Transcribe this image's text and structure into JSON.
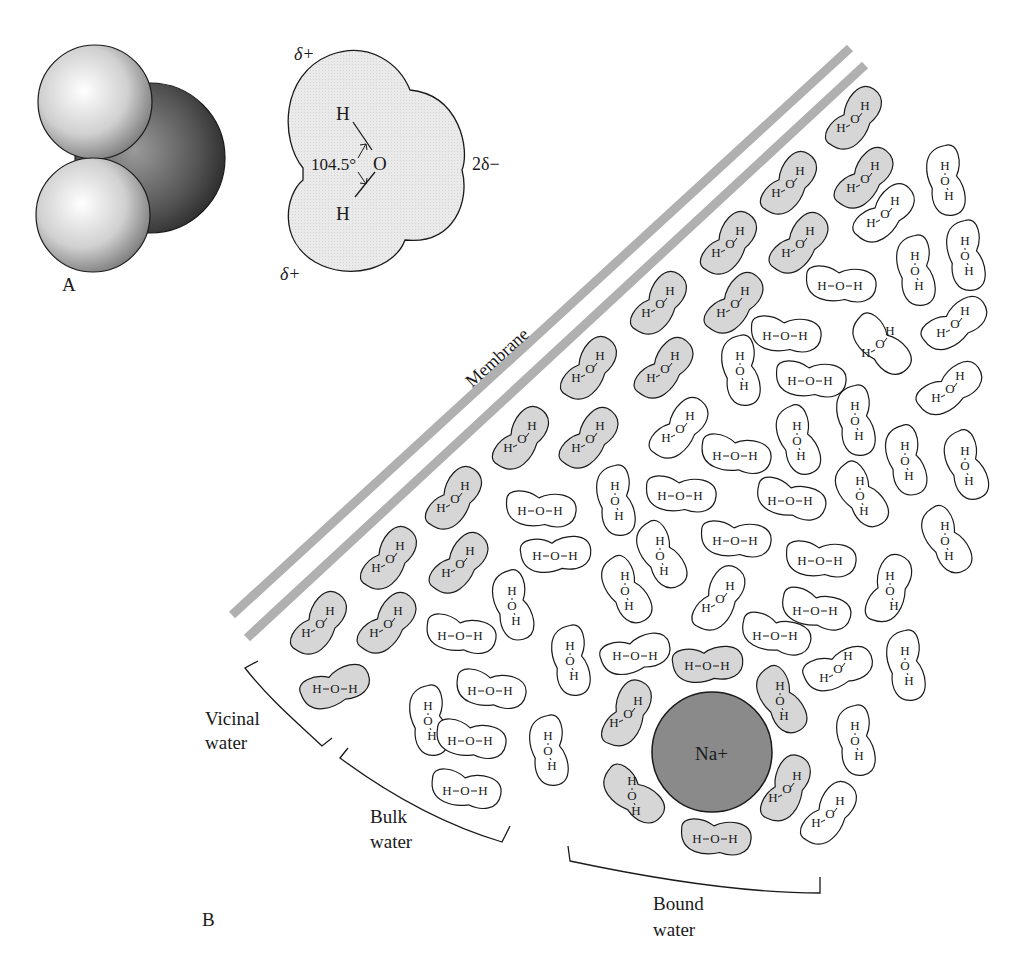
{
  "figure": {
    "panel_a_label": "A",
    "panel_b_label": "B",
    "water_model": {
      "angle_label": "104.5°",
      "oxygen": "O",
      "hydrogen_top": "H",
      "hydrogen_bottom": "H",
      "delta_plus_top": "δ+",
      "delta_plus_bottom": "δ+",
      "delta_minus": "2δ−"
    },
    "membrane_label": "Membrane",
    "regions": {
      "vicinal": [
        "Vicinal",
        "water"
      ],
      "bulk": [
        "Bulk",
        "water"
      ],
      "bound": [
        "Bound",
        "water"
      ]
    },
    "ion_label": "Na+",
    "colors": {
      "shaded_molecule": "#d6d6d6",
      "membrane": "#b0b0b0",
      "ion": "#8a8a8a",
      "outline": "#1a1a1a"
    },
    "molecules": [
      {
        "x": 855,
        "y": 120,
        "rot": -55,
        "shaded": true,
        "form": "bent"
      },
      {
        "x": 790,
        "y": 185,
        "rot": -55,
        "shaded": true,
        "form": "bent"
      },
      {
        "x": 865,
        "y": 180,
        "rot": -50,
        "shaded": true,
        "form": "bent"
      },
      {
        "x": 730,
        "y": 245,
        "rot": -55,
        "shaded": true,
        "form": "bent"
      },
      {
        "x": 800,
        "y": 245,
        "rot": -50,
        "shaded": true,
        "form": "bent"
      },
      {
        "x": 660,
        "y": 305,
        "rot": -55,
        "shaded": true,
        "form": "bent"
      },
      {
        "x": 735,
        "y": 305,
        "rot": -50,
        "shaded": true,
        "form": "bent"
      },
      {
        "x": 590,
        "y": 370,
        "rot": -55,
        "shaded": true,
        "form": "bent"
      },
      {
        "x": 665,
        "y": 370,
        "rot": -50,
        "shaded": true,
        "form": "bent"
      },
      {
        "x": 522,
        "y": 440,
        "rot": -55,
        "shaded": true,
        "form": "bent"
      },
      {
        "x": 590,
        "y": 440,
        "rot": -50,
        "shaded": true,
        "form": "bent"
      },
      {
        "x": 455,
        "y": 500,
        "rot": -55,
        "shaded": true,
        "form": "bent"
      },
      {
        "x": 390,
        "y": 560,
        "rot": -55,
        "shaded": true,
        "form": "bent"
      },
      {
        "x": 460,
        "y": 565,
        "rot": -50,
        "shaded": true,
        "form": "bent"
      },
      {
        "x": 320,
        "y": 625,
        "rot": -55,
        "shaded": true,
        "form": "bent"
      },
      {
        "x": 388,
        "y": 625,
        "rot": -50,
        "shaded": true,
        "form": "bent"
      },
      {
        "x": 335,
        "y": 688,
        "rot": -20,
        "shaded": true,
        "form": "line"
      },
      {
        "x": 945,
        "y": 180,
        "rot": 80,
        "shaded": false,
        "form": "vert"
      },
      {
        "x": 885,
        "y": 215,
        "rot": -45,
        "shaded": false,
        "form": "bent"
      },
      {
        "x": 915,
        "y": 270,
        "rot": 80,
        "shaded": false,
        "form": "vert"
      },
      {
        "x": 965,
        "y": 255,
        "rot": 80,
        "shaded": false,
        "form": "vert"
      },
      {
        "x": 840,
        "y": 285,
        "rot": 5,
        "shaded": false,
        "form": "line"
      },
      {
        "x": 955,
        "y": 325,
        "rot": -35,
        "shaded": false,
        "form": "bent"
      },
      {
        "x": 785,
        "y": 335,
        "rot": 5,
        "shaded": false,
        "form": "line"
      },
      {
        "x": 880,
        "y": 345,
        "rot": 45,
        "shaded": false,
        "form": "bent"
      },
      {
        "x": 740,
        "y": 370,
        "rot": 80,
        "shaded": false,
        "form": "vert"
      },
      {
        "x": 810,
        "y": 380,
        "rot": 5,
        "shaded": false,
        "form": "line"
      },
      {
        "x": 950,
        "y": 390,
        "rot": -35,
        "shaded": false,
        "form": "bent"
      },
      {
        "x": 680,
        "y": 430,
        "rot": -50,
        "shaded": false,
        "form": "bent"
      },
      {
        "x": 735,
        "y": 455,
        "rot": 10,
        "shaded": false,
        "form": "line"
      },
      {
        "x": 797,
        "y": 440,
        "rot": 70,
        "shaded": false,
        "form": "vert"
      },
      {
        "x": 855,
        "y": 420,
        "rot": 80,
        "shaded": false,
        "form": "vert"
      },
      {
        "x": 905,
        "y": 460,
        "rot": 75,
        "shaded": false,
        "form": "vert"
      },
      {
        "x": 965,
        "y": 465,
        "rot": 70,
        "shaded": false,
        "form": "vert"
      },
      {
        "x": 540,
        "y": 510,
        "rot": 5,
        "shaded": false,
        "form": "line"
      },
      {
        "x": 615,
        "y": 500,
        "rot": 80,
        "shaded": false,
        "form": "vert"
      },
      {
        "x": 680,
        "y": 495,
        "rot": 5,
        "shaded": false,
        "form": "line"
      },
      {
        "x": 790,
        "y": 500,
        "rot": 15,
        "shaded": false,
        "form": "line"
      },
      {
        "x": 860,
        "y": 495,
        "rot": 55,
        "shaded": false,
        "form": "vert"
      },
      {
        "x": 945,
        "y": 540,
        "rot": 60,
        "shaded": false,
        "form": "vert"
      },
      {
        "x": 555,
        "y": 555,
        "rot": -5,
        "shaded": false,
        "form": "line"
      },
      {
        "x": 660,
        "y": 555,
        "rot": 60,
        "shaded": false,
        "form": "vert"
      },
      {
        "x": 735,
        "y": 540,
        "rot": 5,
        "shaded": false,
        "form": "line"
      },
      {
        "x": 820,
        "y": 560,
        "rot": 5,
        "shaded": false,
        "form": "line"
      },
      {
        "x": 512,
        "y": 605,
        "rot": 75,
        "shaded": false,
        "form": "vert"
      },
      {
        "x": 625,
        "y": 590,
        "rot": 60,
        "shaded": false,
        "form": "vert"
      },
      {
        "x": 720,
        "y": 600,
        "rot": -60,
        "shaded": false,
        "form": "bent"
      },
      {
        "x": 815,
        "y": 610,
        "rot": 15,
        "shaded": false,
        "form": "line"
      },
      {
        "x": 890,
        "y": 590,
        "rot": -70,
        "shaded": false,
        "form": "vert"
      },
      {
        "x": 460,
        "y": 635,
        "rot": 10,
        "shaded": false,
        "form": "line"
      },
      {
        "x": 775,
        "y": 635,
        "rot": 15,
        "shaded": false,
        "form": "line"
      },
      {
        "x": 570,
        "y": 660,
        "rot": 80,
        "shaded": false,
        "form": "vert"
      },
      {
        "x": 635,
        "y": 655,
        "rot": -15,
        "shaded": false,
        "form": "line"
      },
      {
        "x": 838,
        "y": 670,
        "rot": -20,
        "shaded": false,
        "form": "bent"
      },
      {
        "x": 905,
        "y": 665,
        "rot": 80,
        "shaded": false,
        "form": "vert"
      },
      {
        "x": 428,
        "y": 720,
        "rot": 80,
        "shaded": false,
        "form": "vert"
      },
      {
        "x": 490,
        "y": 690,
        "rot": 10,
        "shaded": false,
        "form": "line"
      },
      {
        "x": 470,
        "y": 740,
        "rot": 10,
        "shaded": false,
        "form": "line"
      },
      {
        "x": 548,
        "y": 750,
        "rot": 80,
        "shaded": false,
        "form": "vert"
      },
      {
        "x": 465,
        "y": 790,
        "rot": 10,
        "shaded": false,
        "form": "line"
      },
      {
        "x": 855,
        "y": 740,
        "rot": 80,
        "shaded": false,
        "form": "vert"
      },
      {
        "x": 830,
        "y": 815,
        "rot": -55,
        "shaded": false,
        "form": "bent"
      },
      {
        "x": 707,
        "y": 665,
        "rot": -5,
        "shaded": true,
        "form": "line"
      },
      {
        "x": 628,
        "y": 715,
        "rot": -65,
        "shaded": true,
        "form": "bent"
      },
      {
        "x": 780,
        "y": 700,
        "rot": 60,
        "shaded": true,
        "form": "vert"
      },
      {
        "x": 632,
        "y": 795,
        "rot": 40,
        "shaded": true,
        "form": "vert"
      },
      {
        "x": 787,
        "y": 790,
        "rot": -65,
        "shaded": true,
        "form": "bent"
      },
      {
        "x": 715,
        "y": 838,
        "rot": 5,
        "shaded": true,
        "form": "line"
      }
    ]
  }
}
